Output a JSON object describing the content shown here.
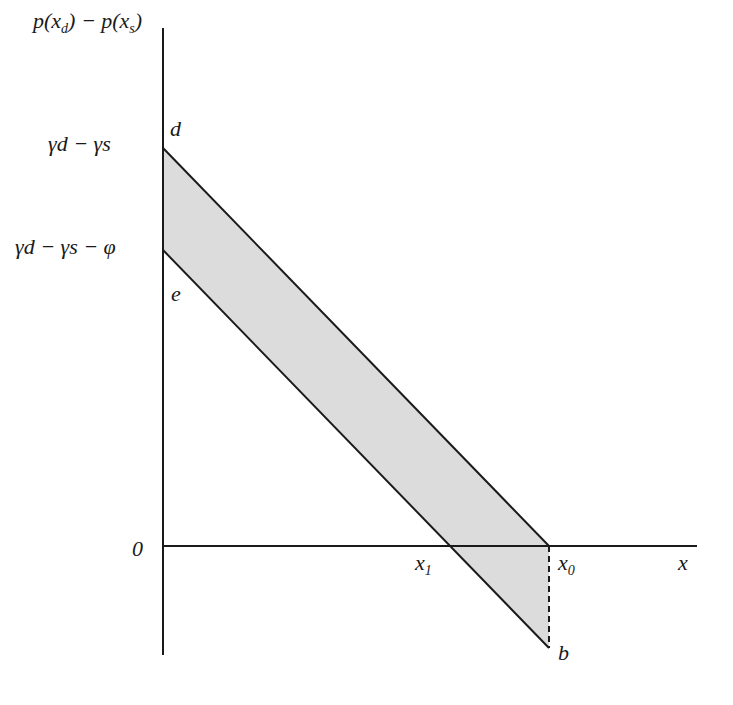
{
  "diagram": {
    "y_axis_label": {
      "p1": "p(x",
      "sub1": "d",
      "mid": ") − p(x",
      "sub2": "s",
      "end": ")"
    },
    "x_axis_label": "x",
    "origin_label": "0",
    "ticks_y": [
      {
        "text": "γd − γs"
      },
      {
        "text": "γd − γs − φ"
      }
    ],
    "ticks_x": [
      {
        "main": "x",
        "sub": "1"
      },
      {
        "main": "x",
        "sub": "0"
      }
    ],
    "point_labels": {
      "d": "d",
      "e": "e",
      "b": "b"
    },
    "colors": {
      "line": "#1a1a1a",
      "fill": "#d9d9d9"
    }
  }
}
